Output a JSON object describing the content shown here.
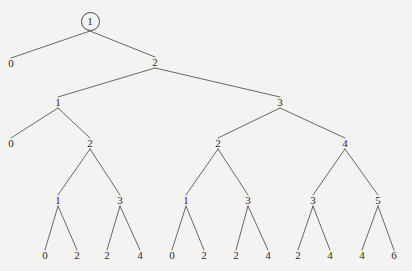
{
  "diagram": {
    "type": "recursion-tree",
    "title": "",
    "background_color": "#f4f3f1",
    "line_color": "#5a5754",
    "text_color": "#2a2a2a",
    "root_highlight": {
      "shape": "circle",
      "node_id": "n0",
      "cx": 90,
      "cy": 21,
      "r": 9.5
    },
    "nodes": [
      {
        "id": "n0",
        "label": "1",
        "x": 90,
        "y": 21,
        "level": 0,
        "circled": true,
        "leaf": false
      },
      {
        "id": "n1",
        "label": "0",
        "x": 11,
        "y": 63,
        "level": 1,
        "circled": false,
        "leaf": true
      },
      {
        "id": "n2",
        "label": "2",
        "x": 155,
        "y": 62,
        "level": 1,
        "circled": false,
        "leaf": false
      },
      {
        "id": "n3",
        "label": "1",
        "x": 58,
        "y": 102,
        "level": 2,
        "circled": false,
        "leaf": false
      },
      {
        "id": "n4",
        "label": "3",
        "x": 280,
        "y": 102,
        "level": 2,
        "circled": false,
        "leaf": false
      },
      {
        "id": "n5",
        "label": "0",
        "x": 11,
        "y": 143,
        "level": 3,
        "circled": false,
        "leaf": true
      },
      {
        "id": "n6",
        "label": "2",
        "x": 90,
        "y": 143,
        "level": 3,
        "circled": false,
        "leaf": false
      },
      {
        "id": "n7",
        "label": "2",
        "x": 218,
        "y": 143,
        "level": 3,
        "circled": false,
        "leaf": false
      },
      {
        "id": "n8",
        "label": "4",
        "x": 345,
        "y": 143,
        "level": 3,
        "circled": false,
        "leaf": false
      },
      {
        "id": "n9",
        "label": "1",
        "x": 58,
        "y": 200,
        "level": 4,
        "circled": false,
        "leaf": false
      },
      {
        "id": "n10",
        "label": "3",
        "x": 120,
        "y": 200,
        "level": 4,
        "circled": false,
        "leaf": false
      },
      {
        "id": "n11",
        "label": "1",
        "x": 186,
        "y": 200,
        "level": 4,
        "circled": false,
        "leaf": false
      },
      {
        "id": "n12",
        "label": "3",
        "x": 248,
        "y": 200,
        "level": 4,
        "circled": false,
        "leaf": false
      },
      {
        "id": "n13",
        "label": "3",
        "x": 313,
        "y": 200,
        "level": 4,
        "circled": false,
        "leaf": false
      },
      {
        "id": "n14",
        "label": "5",
        "x": 378,
        "y": 200,
        "level": 4,
        "circled": false,
        "leaf": false
      },
      {
        "id": "n15",
        "label": "0",
        "x": 45,
        "y": 255,
        "level": 5,
        "circled": false,
        "leaf": true
      },
      {
        "id": "n16",
        "label": "2",
        "x": 77,
        "y": 255,
        "level": 5,
        "circled": false,
        "leaf": true
      },
      {
        "id": "n17",
        "label": "2",
        "x": 107,
        "y": 255,
        "level": 5,
        "circled": false,
        "leaf": true
      },
      {
        "id": "n18",
        "label": "4",
        "x": 140,
        "y": 255,
        "level": 5,
        "circled": false,
        "leaf": true
      },
      {
        "id": "n19",
        "label": "0",
        "x": 172,
        "y": 255,
        "level": 5,
        "circled": false,
        "leaf": true
      },
      {
        "id": "n20",
        "label": "2",
        "x": 204,
        "y": 255,
        "level": 5,
        "circled": false,
        "leaf": true
      },
      {
        "id": "n21",
        "label": "2",
        "x": 236,
        "y": 255,
        "level": 5,
        "circled": false,
        "leaf": true
      },
      {
        "id": "n22",
        "label": "4",
        "x": 268,
        "y": 255,
        "level": 5,
        "circled": false,
        "leaf": true
      },
      {
        "id": "n23",
        "label": "2",
        "x": 298,
        "y": 255,
        "level": 5,
        "circled": false,
        "leaf": true
      },
      {
        "id": "n24",
        "label": "4",
        "x": 330,
        "y": 255,
        "level": 5,
        "circled": false,
        "leaf": true
      },
      {
        "id": "n25",
        "label": "4",
        "x": 362,
        "y": 255,
        "level": 5,
        "circled": false,
        "leaf": true
      },
      {
        "id": "n26",
        "label": "6",
        "x": 394,
        "y": 255,
        "level": 5,
        "circled": false,
        "leaf": true
      }
    ],
    "edges": [
      {
        "from": "n0",
        "to": "n1"
      },
      {
        "from": "n0",
        "to": "n2"
      },
      {
        "from": "n2",
        "to": "n3"
      },
      {
        "from": "n2",
        "to": "n4"
      },
      {
        "from": "n3",
        "to": "n5"
      },
      {
        "from": "n3",
        "to": "n6"
      },
      {
        "from": "n4",
        "to": "n7"
      },
      {
        "from": "n4",
        "to": "n8"
      },
      {
        "from": "n6",
        "to": "n9"
      },
      {
        "from": "n6",
        "to": "n10"
      },
      {
        "from": "n7",
        "to": "n11"
      },
      {
        "from": "n7",
        "to": "n12"
      },
      {
        "from": "n8",
        "to": "n13"
      },
      {
        "from": "n8",
        "to": "n14"
      },
      {
        "from": "n9",
        "to": "n15"
      },
      {
        "from": "n9",
        "to": "n16"
      },
      {
        "from": "n10",
        "to": "n17"
      },
      {
        "from": "n10",
        "to": "n18"
      },
      {
        "from": "n11",
        "to": "n19"
      },
      {
        "from": "n11",
        "to": "n20"
      },
      {
        "from": "n12",
        "to": "n21"
      },
      {
        "from": "n12",
        "to": "n22"
      },
      {
        "from": "n13",
        "to": "n23"
      },
      {
        "from": "n13",
        "to": "n24"
      },
      {
        "from": "n14",
        "to": "n25"
      },
      {
        "from": "n14",
        "to": "n26"
      }
    ]
  }
}
